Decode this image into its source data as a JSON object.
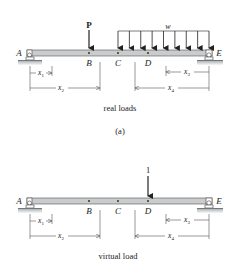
{
  "figure_a": {
    "loads": {
      "point_load_label": "P",
      "distributed_load_label": "w"
    },
    "points": {
      "A": "A",
      "B": "B",
      "C": "C",
      "D": "D",
      "E": "E"
    },
    "dimensions": {
      "x1": "x",
      "x1_sub": "1",
      "x2": "x",
      "x2_sub": "2",
      "x3": "x",
      "x3_sub": "3",
      "x4": "x",
      "x4_sub": "4"
    },
    "caption": "real loads",
    "sub_label": "(a)"
  },
  "figure_b": {
    "loads": {
      "unit_load_label": "1"
    },
    "points": {
      "A": "A",
      "B": "B",
      "C": "C",
      "D": "D",
      "E": "E"
    },
    "dimensions": {
      "x1": "x",
      "x1_sub": "1",
      "x2": "x",
      "x2_sub": "2",
      "x3": "x",
      "x3_sub": "3",
      "x4": "x",
      "x4_sub": "4"
    },
    "caption": "virtual load"
  },
  "colors": {
    "beam_fill": "#c9cbcc",
    "beam_stroke": "#555555",
    "ground": "#bfc5c8",
    "ink": "#222222"
  }
}
